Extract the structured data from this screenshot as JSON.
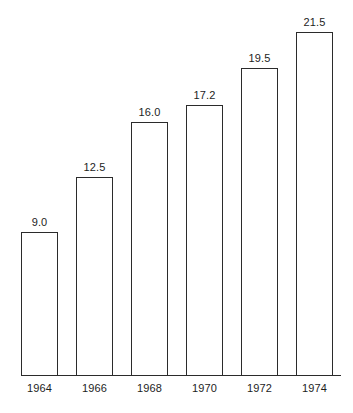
{
  "chart_data": {
    "type": "bar",
    "title": "",
    "subtitle": "",
    "xlabel": "",
    "ylabel": "",
    "categories": [
      "1964",
      "1966",
      "1968",
      "1970",
      "1972",
      "1974"
    ],
    "values": [
      9.0,
      12.5,
      16.0,
      17.2,
      19.5,
      21.5
    ],
    "value_labels": [
      "9.0",
      "12.5",
      "16.0",
      "17.2",
      "19.5",
      "21.5"
    ],
    "series": [
      {
        "name": "",
        "values": [
          9.0,
          12.5,
          16.0,
          17.2,
          19.5,
          21.5
        ]
      }
    ],
    "ylim": [
      0,
      21.5
    ],
    "xlim_categories": 6,
    "grid": false,
    "legend": false,
    "legend_position": "none",
    "y_axis_visible": false,
    "x_axis_visible": true,
    "y_tick_labels": [],
    "x_tick_labels": [
      "1964",
      "1966",
      "1968",
      "1970",
      "1972",
      "1974"
    ],
    "bar_fill_color": "#ffffff",
    "bar_outline_color": "#2b2b2b",
    "axis_color": "#2b2b2b",
    "text_color": "#1d1d1d",
    "background_color": "#ffffff",
    "annotations": []
  },
  "layout": {
    "baseline_y": 375,
    "axis_left_x": 21,
    "axis_right_x": 341,
    "bar_width": 37,
    "pixels_per_unit": 15.95,
    "bars": [
      {
        "left": 21,
        "top": 232
      },
      {
        "left": 76,
        "top": 177
      },
      {
        "left": 131,
        "top": 122
      },
      {
        "left": 186,
        "top": 105
      },
      {
        "left": 241,
        "top": 68
      },
      {
        "left": 296,
        "top": 32
      }
    ]
  }
}
